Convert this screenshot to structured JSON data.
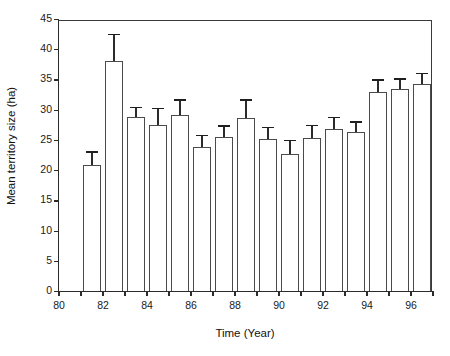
{
  "chart_data": {
    "type": "bar",
    "title": "",
    "xlabel": "Time (Year)",
    "ylabel": "Mean territory size (ha)",
    "categories": [
      "81",
      "82",
      "83",
      "84",
      "85",
      "86",
      "87",
      "88",
      "89",
      "90",
      "91",
      "92",
      "93",
      "94",
      "95",
      "96"
    ],
    "values": [
      20.9,
      38.1,
      28.8,
      27.5,
      29.1,
      23.8,
      25.4,
      28.7,
      25.2,
      22.7,
      25.3,
      26.8,
      26.3,
      33.0,
      33.5,
      34.2
    ],
    "errors": [
      2.2,
      4.5,
      1.7,
      2.8,
      2.6,
      2.0,
      2.0,
      3.0,
      2.0,
      2.3,
      2.2,
      2.0,
      1.8,
      2.0,
      1.7,
      1.9
    ],
    "error_type": "standard-error",
    "ylim": [
      0,
      45
    ],
    "xlim": [
      80,
      97
    ],
    "y_ticks": [
      0,
      5,
      10,
      15,
      20,
      25,
      30,
      35,
      40,
      45
    ],
    "y_tick_labels": [
      "0",
      "5",
      "10",
      "15",
      "20",
      "25",
      "30",
      "35",
      "40",
      "45"
    ],
    "x_ticks": [
      80,
      81,
      82,
      83,
      84,
      85,
      86,
      87,
      88,
      89,
      90,
      91,
      92,
      93,
      94,
      95,
      96,
      97
    ],
    "x_tick_labels": [
      {
        "value": 80,
        "label": "80"
      },
      {
        "value": 82,
        "label": "82"
      },
      {
        "value": 84,
        "label": "84"
      },
      {
        "value": 86,
        "label": "86"
      },
      {
        "value": 88,
        "label": "88"
      },
      {
        "value": 90,
        "label": "90"
      },
      {
        "value": 92,
        "label": "92"
      },
      {
        "value": 94,
        "label": "94"
      },
      {
        "value": 96,
        "label": "96"
      }
    ],
    "grid": false,
    "legend": false,
    "bar_fill": "#ffffff",
    "bar_edge": "#4a4a4a",
    "axis_color": "#2b2b2b",
    "text_color": "#111111",
    "background": "#ffffff"
  }
}
